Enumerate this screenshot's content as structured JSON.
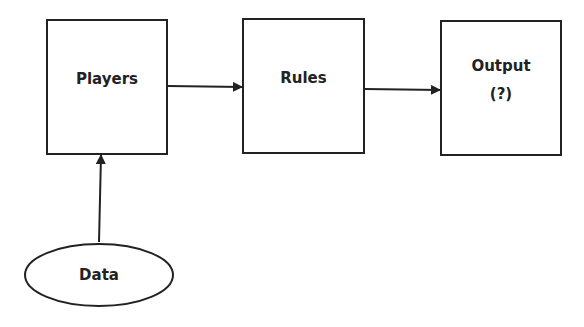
{
  "diagram": {
    "nodes": {
      "players": {
        "label": "Players",
        "shape": "rectangle"
      },
      "rules": {
        "label": "Rules",
        "shape": "rectangle"
      },
      "output": {
        "label": "Output",
        "sublabel": "(?)",
        "shape": "rectangle"
      },
      "data": {
        "label": "Data",
        "shape": "ellipse"
      }
    },
    "edges": [
      {
        "from": "players",
        "to": "rules"
      },
      {
        "from": "rules",
        "to": "output"
      },
      {
        "from": "data",
        "to": "players"
      }
    ],
    "colors": {
      "stroke": "#222222",
      "background": "#ffffff"
    }
  }
}
